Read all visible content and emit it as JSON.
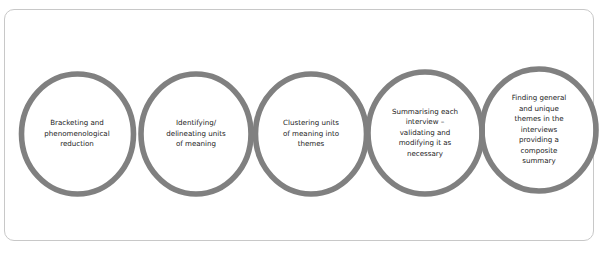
{
  "figure": {
    "frame_border_color": "#c8c8c8",
    "background_color": "#ffffff",
    "shape_color": "#808080",
    "text_color": "#1a1a1a"
  },
  "process": {
    "stages": [
      {
        "index": 1,
        "label": "Bracketing and\nphenomenological\nreduction",
        "name": "stage-bracketing-and-phenomenological-reduction"
      },
      {
        "index": 2,
        "label": "Identifying/\ndelineating units\nof meaning",
        "name": "stage-identifying-delineating-units-of-meaning"
      },
      {
        "index": 3,
        "label": "Clustering units\nof meaning into\nthemes",
        "name": "stage-clustering-units-of-meaning-into-themes"
      },
      {
        "index": 4,
        "label": "Summarising each\ninterview –\nvalidating and\nmodifying it as\nnecessary",
        "name": "stage-summarising-each-interview"
      },
      {
        "index": 5,
        "label": "Finding general\nand unique\nthemes in the\ninterviews\nproviding a\ncomposite\nsummary",
        "name": "stage-finding-general-and-unique-themes"
      }
    ],
    "connectors": [
      {
        "from": 1,
        "to": 2,
        "name": "arrow-stage-1-to-2"
      },
      {
        "from": 2,
        "to": 3,
        "name": "arrow-stage-2-to-3"
      },
      {
        "from": 3,
        "to": 4,
        "name": "arrow-stage-3-to-4"
      },
      {
        "from": 4,
        "to": 5,
        "name": "arrow-stage-4-to-5"
      }
    ]
  }
}
